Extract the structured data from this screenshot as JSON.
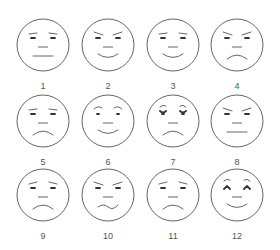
{
  "figure": {
    "stroke_color": "#666666",
    "faces": [
      {
        "label": "1",
        "expression": "neutral-flat-mouth",
        "col": 0,
        "row": 0
      },
      {
        "label": "2",
        "expression": "slight-frown-brows-smile",
        "col": 1,
        "row": 0
      },
      {
        "label": "3",
        "expression": "smile",
        "col": 2,
        "row": 0
      },
      {
        "label": "4",
        "expression": "angry-frown",
        "col": 3,
        "row": 0
      },
      {
        "label": "5",
        "expression": "sad",
        "col": 0,
        "row": 1
      },
      {
        "label": "6",
        "expression": "happy-raised-brows",
        "col": 1,
        "row": 1
      },
      {
        "label": "7",
        "expression": "worried-sad",
        "col": 2,
        "row": 1
      },
      {
        "label": "8",
        "expression": "angry-flat-mouth",
        "col": 3,
        "row": 1
      },
      {
        "label": "9",
        "expression": "sad-tilted-brows",
        "col": 0,
        "row": 2
      },
      {
        "label": "10",
        "expression": "angry-wavy-mouth",
        "col": 1,
        "row": 2
      },
      {
        "label": "11",
        "expression": "sad-concerned",
        "col": 2,
        "row": 2
      },
      {
        "label": "12",
        "expression": "happy-arched-brows",
        "col": 3,
        "row": 2
      }
    ]
  }
}
